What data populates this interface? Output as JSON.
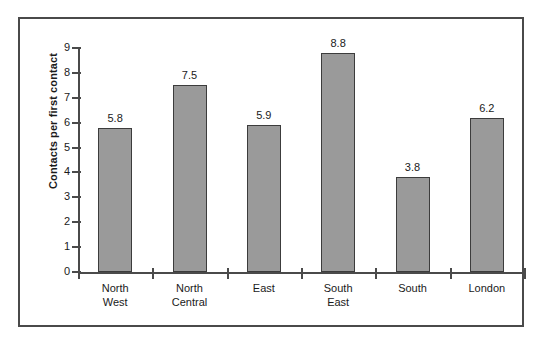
{
  "chart_data": {
    "type": "bar",
    "title": "",
    "xlabel": "",
    "ylabel": "Contacts per first contact",
    "ylim": [
      0,
      9
    ],
    "yticks": [
      "0",
      "1",
      "2",
      "3",
      "4",
      "5",
      "6",
      "7",
      "8",
      "9"
    ],
    "grid": false,
    "legend": "none",
    "categories": [
      "North West",
      "North Central",
      "East",
      "South East",
      "South",
      "London"
    ],
    "category_lines": [
      [
        "North",
        "West"
      ],
      [
        "North",
        "Central"
      ],
      [
        "East",
        ""
      ],
      [
        "South",
        "East"
      ],
      [
        "South",
        ""
      ],
      [
        "London",
        ""
      ]
    ],
    "values": [
      5.8,
      7.5,
      5.9,
      8.8,
      3.8,
      6.2
    ],
    "value_labels": [
      "5.8",
      "7.5",
      "5.9",
      "8.8",
      "3.8",
      "6.2"
    ],
    "colors": {
      "bar_fill": "#9a9a9a",
      "bar_border": "#3c3c3c",
      "axis": "#4a4a4a",
      "frame": "#4a4a4a",
      "text": "#1a1a1a",
      "background": "#ffffff"
    }
  }
}
